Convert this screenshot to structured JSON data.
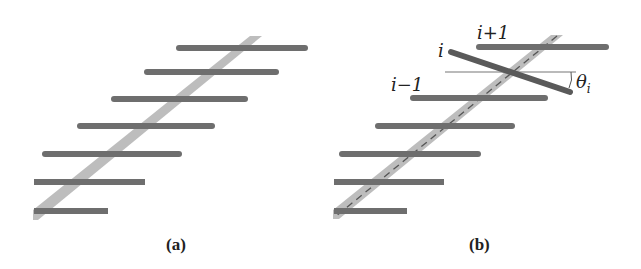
{
  "figure": {
    "panels": [
      {
        "id": "a",
        "caption": "(a)",
        "description": "Staircase of horizontal rods crossing a diagonal band",
        "rod_count": 7
      },
      {
        "id": "b",
        "caption": "(b)",
        "description": "Same structure with rod i rotated by angle theta_i about the dashed centerline",
        "rod_count": 7,
        "labels": {
          "next": "i+1",
          "current": "i",
          "previous": "i−1",
          "angle": "θ",
          "angle_sub": "i"
        }
      }
    ],
    "colors": {
      "rod": "#6e6e6e",
      "rod_edge": "#4a4a4a",
      "band": "#b8b8b8",
      "dash": "#555555",
      "reference_line": "#777777",
      "text": "#222222"
    }
  }
}
